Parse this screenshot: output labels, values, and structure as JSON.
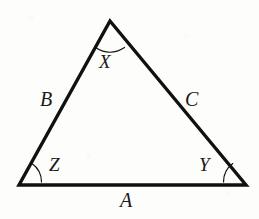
{
  "figure": {
    "type": "geometry-diagram",
    "shape": "triangle",
    "background_color": "#fdfdfc",
    "stroke_color": "#111111",
    "side_stroke_width": 3.4,
    "arc_stroke_width": 1.2,
    "vertices": {
      "apex": {
        "name": "apex-vertex",
        "x": 110,
        "y": 21
      },
      "bottom_left": {
        "name": "bottom-left-vertex",
        "x": 19,
        "y": 185
      },
      "bottom_right": {
        "name": "bottom-right-vertex",
        "x": 246,
        "y": 185
      }
    },
    "angle_labels": {
      "apex": "X",
      "bottom_left": "Z",
      "bottom_right": "Y"
    },
    "side_labels": {
      "bottom": "A",
      "left": "B",
      "right": "C"
    },
    "angle_arcs": [
      {
        "name": "apex-angle-arc",
        "path": "M 95.5 47.5 Q 110 57 124.5 47.5"
      },
      {
        "name": "bottom-left-angle-arc",
        "path": "M 41.5 182 A 23 23 0 0 0 31.6 163.2"
      },
      {
        "name": "bottom-right-angle-arc",
        "path": "M 223.5 182 A 23 23 0 0 1 232.8 163.6"
      }
    ]
  }
}
